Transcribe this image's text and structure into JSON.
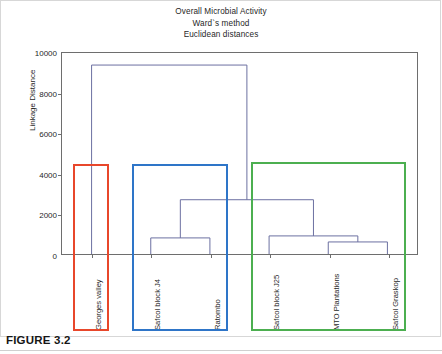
{
  "figure": {
    "caption": "FIGURE 3.2"
  },
  "chart_data": {
    "type": "dendrogram",
    "title": "Overall Microbial Activity",
    "subtitle": "Ward`s method",
    "subtitle2": "Euclidean distances",
    "xlabel": "",
    "ylabel": "Linkage Distance",
    "ylim": [
      0,
      10000
    ],
    "yticks": [
      0,
      2000,
      4000,
      6000,
      8000,
      10000
    ],
    "ytick_labels": [
      "0",
      "2000",
      "4000",
      "6000",
      "8000",
      "10000"
    ],
    "grid": false,
    "legend": "none",
    "leaves": [
      "Georges valley",
      "Safcol block J4",
      "Ratombo",
      "Safcol block J25",
      "MTO Plantations",
      "Safcol Graskop"
    ],
    "merges": [
      {
        "name": "merge-j4-ratombo",
        "children": [
          "Safcol block J4",
          "Ratombo"
        ],
        "height": 800
      },
      {
        "name": "merge-mto-graskop",
        "children": [
          "MTO Plantations",
          "Safcol Graskop"
        ],
        "height": 600
      },
      {
        "name": "merge-j25-group",
        "children": [
          "Safcol block J25",
          "merge-mto-graskop"
        ],
        "height": 900
      },
      {
        "name": "merge-mid",
        "children": [
          "merge-j4-ratombo",
          "merge-j25-group"
        ],
        "height": 2700
      },
      {
        "name": "merge-root",
        "children": [
          "Georges valley",
          "merge-mid"
        ],
        "height": 9400
      }
    ],
    "clusters": [
      {
        "name": "cluster-red",
        "color": "#E8472B",
        "members": [
          "Georges valley"
        ],
        "box_top_value": 4500
      },
      {
        "name": "cluster-blue",
        "color": "#2E75C8",
        "members": [
          "Safcol block J4",
          "Ratombo"
        ],
        "box_top_value": 4500
      },
      {
        "name": "cluster-green",
        "color": "#4CAF50",
        "members": [
          "Safcol block J25",
          "MTO Plantations",
          "Safcol Graskop"
        ],
        "box_top_value": 4600
      }
    ],
    "link_color": "#6b6fa0",
    "axis_color": "#6e6e6e"
  }
}
